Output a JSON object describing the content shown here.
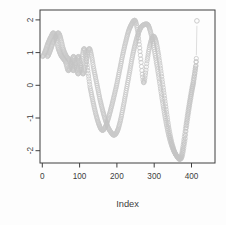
{
  "chart_data": {
    "type": "scatter",
    "title": "",
    "xlabel": "Index",
    "ylabel": "",
    "marker": "open-circle",
    "x_ticks": [
      0,
      100,
      200,
      300,
      400
    ],
    "y_ticks": [
      -2,
      -1,
      0,
      1,
      2
    ],
    "xlim": [
      -15,
      462
    ],
    "ylim": [
      -2.4,
      2.3
    ],
    "grid": false,
    "legend": "none",
    "box": true,
    "colors": {
      "marker": "#c4c4c4",
      "axis": "#3f3f3f",
      "text": "#3d3d3d",
      "background": "#fdfdfd"
    },
    "sampling_note": "dense point series (~1 point per index) interpolated through control points",
    "series": [
      {
        "name": "trace-1",
        "control_points": [
          [
            1,
            0.88
          ],
          [
            8,
            1.05
          ],
          [
            15,
            1.28
          ],
          [
            24,
            1.5
          ],
          [
            30,
            1.6
          ],
          [
            36,
            1.45
          ],
          [
            43,
            1.12
          ],
          [
            50,
            0.92
          ],
          [
            56,
            0.82
          ],
          [
            62,
            0.72
          ],
          [
            70,
            0.45
          ],
          [
            78,
            0.7
          ],
          [
            84,
            0.88
          ],
          [
            90,
            0.6
          ],
          [
            96,
            0.35
          ],
          [
            102,
            0.55
          ],
          [
            108,
            0.95
          ],
          [
            112,
            1.12
          ],
          [
            116,
            0.95
          ],
          [
            122,
            0.45
          ],
          [
            128,
            -0.05
          ],
          [
            136,
            -0.5
          ],
          [
            144,
            -0.9
          ],
          [
            152,
            -1.2
          ],
          [
            160,
            -1.37
          ],
          [
            168,
            -1.3
          ],
          [
            176,
            -1.05
          ],
          [
            184,
            -0.72
          ],
          [
            192,
            -0.35
          ],
          [
            200,
            0.05
          ],
          [
            208,
            0.5
          ],
          [
            216,
            0.95
          ],
          [
            224,
            1.35
          ],
          [
            232,
            1.68
          ],
          [
            240,
            1.88
          ],
          [
            246,
            1.98
          ],
          [
            250,
            1.95
          ],
          [
            255,
            1.7
          ],
          [
            260,
            1.25
          ],
          [
            265,
            0.7
          ],
          [
            269,
            0.25
          ],
          [
            272,
            0.08
          ],
          [
            276,
            0.3
          ],
          [
            281,
            0.75
          ],
          [
            287,
            1.15
          ],
          [
            293,
            1.4
          ],
          [
            298,
            1.5
          ],
          [
            304,
            1.38
          ],
          [
            310,
            1.05
          ],
          [
            316,
            0.6
          ],
          [
            322,
            0.1
          ],
          [
            328,
            -0.4
          ],
          [
            334,
            -0.9
          ],
          [
            340,
            -1.35
          ],
          [
            346,
            -1.7
          ],
          [
            352,
            -1.95
          ],
          [
            358,
            -2.12
          ],
          [
            364,
            -2.22
          ],
          [
            368,
            -2.26
          ],
          [
            372,
            -2.18
          ],
          [
            376,
            -1.95
          ],
          [
            380,
            -1.65
          ],
          [
            384,
            -1.32
          ],
          [
            388,
            -1.0
          ],
          [
            392,
            -0.7
          ],
          [
            396,
            -0.42
          ],
          [
            400,
            -0.16
          ],
          [
            404,
            0.08
          ],
          [
            408,
            0.35
          ],
          [
            411,
            0.58
          ],
          [
            413,
            0.82
          ]
        ]
      },
      {
        "name": "trace-2",
        "control_points": [
          [
            14,
            0.88
          ],
          [
            21,
            1.05
          ],
          [
            28,
            1.28
          ],
          [
            37,
            1.5
          ],
          [
            43,
            1.6
          ],
          [
            49,
            1.45
          ],
          [
            56,
            1.12
          ],
          [
            63,
            0.92
          ],
          [
            69,
            0.82
          ],
          [
            75,
            0.72
          ],
          [
            83,
            0.45
          ],
          [
            91,
            0.7
          ],
          [
            97,
            0.88
          ],
          [
            103,
            0.6
          ],
          [
            109,
            0.35
          ],
          [
            115,
            0.55
          ],
          [
            121,
            0.95
          ],
          [
            126,
            1.12
          ],
          [
            131,
            0.95
          ],
          [
            138,
            0.5
          ],
          [
            146,
            0.05
          ],
          [
            155,
            -0.45
          ],
          [
            165,
            -0.9
          ],
          [
            175,
            -1.25
          ],
          [
            185,
            -1.45
          ],
          [
            193,
            -1.52
          ],
          [
            202,
            -1.38
          ],
          [
            210,
            -1.05
          ],
          [
            218,
            -0.6
          ],
          [
            226,
            -0.1
          ],
          [
            234,
            0.4
          ],
          [
            242,
            0.9
          ],
          [
            250,
            1.3
          ],
          [
            258,
            1.6
          ],
          [
            265,
            1.78
          ],
          [
            272,
            1.85
          ],
          [
            278,
            1.87
          ],
          [
            283,
            1.85
          ],
          [
            288,
            1.72
          ],
          [
            294,
            1.45
          ],
          [
            300,
            1.1
          ],
          [
            306,
            0.7
          ],
          [
            312,
            0.28
          ],
          [
            318,
            -0.18
          ],
          [
            324,
            -0.62
          ],
          [
            330,
            -1.02
          ],
          [
            336,
            -1.38
          ],
          [
            342,
            -1.66
          ],
          [
            348,
            -1.88
          ],
          [
            354,
            -2.04
          ],
          [
            360,
            -2.15
          ],
          [
            366,
            -2.22
          ],
          [
            371,
            -2.25
          ],
          [
            375,
            -2.16
          ],
          [
            379,
            -1.93
          ],
          [
            383,
            -1.63
          ],
          [
            386,
            -1.3
          ],
          [
            390,
            -0.98
          ],
          [
            394,
            -0.68
          ],
          [
            398,
            -0.4
          ],
          [
            402,
            -0.14
          ],
          [
            406,
            0.1
          ],
          [
            409,
            0.36
          ],
          [
            412,
            0.6
          ],
          [
            413,
            0.72
          ]
        ]
      }
    ],
    "tail": {
      "line": [
        [
          413,
          0.92
        ],
        [
          414.5,
          1.82
        ]
      ],
      "end_point": [
        414.5,
        1.97
      ]
    }
  }
}
